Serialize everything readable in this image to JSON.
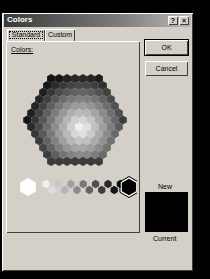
{
  "window": {
    "title": "Colors",
    "help_label": "?",
    "close_label": "×"
  },
  "tabs": [
    {
      "label": "Standard",
      "active": true
    },
    {
      "label": "Custom",
      "active": false
    }
  ],
  "panel": {
    "colors_label": "Colors:"
  },
  "buttons": {
    "ok_label": "OK",
    "cancel_label": "Cancel"
  },
  "preview": {
    "new_label": "New",
    "current_label": "Current",
    "new_color": "#000000",
    "current_color": "#000000"
  },
  "grayscale_row": {
    "selected_index": 14,
    "colors": [
      "#ffffff",
      "#f0f0f0",
      "#dddddd",
      "#c8c8c8",
      "#b4b4b4",
      "#a0a0a0",
      "#8c8c8c",
      "#787878",
      "#646464",
      "#505050",
      "#3c3c3c",
      "#282828",
      "#141414",
      "#0a0a0a",
      "#000000"
    ]
  }
}
